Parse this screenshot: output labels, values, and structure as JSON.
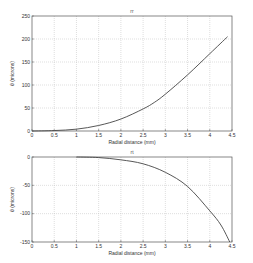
{
  "chart_data": [
    {
      "type": "line",
      "title": "rr",
      "xlabel": "Radial distance (mm)",
      "ylabel": "θ (microns)",
      "xlim": [
        0,
        4.5
      ],
      "ylim": [
        0,
        250
      ],
      "xticks": [
        "0",
        "0.5",
        "1",
        "1.5",
        "2",
        "2.5",
        "3",
        "3.5",
        "4",
        "4.5"
      ],
      "yticks": [
        "0",
        "50",
        "100",
        "150",
        "200",
        "250"
      ],
      "grid": true,
      "series": [
        {
          "name": "top-curve",
          "x": [
            0,
            0.5,
            1.0,
            1.5,
            2.0,
            2.5,
            2.75,
            3.0,
            3.5,
            4.0,
            4.4
          ],
          "values": [
            0,
            1,
            4,
            12,
            26,
            48,
            62,
            80,
            122,
            168,
            205
          ]
        }
      ]
    },
    {
      "type": "line",
      "title": "rt",
      "xlabel": "Radial distance (mm)",
      "ylabel": "θ (microns)",
      "xlim": [
        0,
        4.5
      ],
      "ylim": [
        -150,
        0
      ],
      "xticks": [
        "0",
        "0.5",
        "1",
        "1.5",
        "2",
        "2.5",
        "3",
        "3.5",
        "4",
        "4.5"
      ],
      "yticks": [
        "0",
        "-50",
        "-100",
        "-150"
      ],
      "grid": true,
      "series": [
        {
          "name": "bottom-curve",
          "x": [
            1.0,
            1.5,
            2.0,
            2.5,
            3.0,
            3.5,
            4.0,
            4.25,
            4.45
          ],
          "values": [
            0,
            -1,
            -5,
            -12,
            -27,
            -52,
            -95,
            -120,
            -150
          ]
        }
      ]
    }
  ]
}
